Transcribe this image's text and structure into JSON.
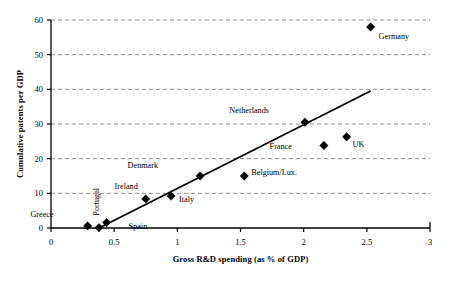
{
  "chart_data": {
    "type": "scatter",
    "title": "",
    "xlabel": "Gross R&D spending (as % of GDP)",
    "ylabel": "Cumulative patents per GDP",
    "xlim": [
      0,
      3
    ],
    "ylim": [
      0,
      60
    ],
    "xticks": [
      "0",
      "0.5",
      "1",
      "1.5",
      "2",
      "2.5",
      "3"
    ],
    "xtick_values": [
      0,
      0.5,
      1,
      1.5,
      2,
      2.5,
      3
    ],
    "yticks": [
      "0",
      "10",
      "20",
      "30",
      "40",
      "50",
      "60"
    ],
    "ytick_values": [
      0,
      10,
      20,
      30,
      40,
      50,
      60
    ],
    "grid": "horizontal-dashed",
    "legend": "none",
    "marker": "diamond",
    "marker_color": "#000000",
    "axis_color": "#000000",
    "grid_color": "#8c8c8c",
    "points": [
      {
        "label": "Greece",
        "x": 0.29,
        "y": 0.6,
        "label_dx": -34,
        "label_dy": -9,
        "rotate": 0
      },
      {
        "label": "Portugal",
        "x": 0.38,
        "y": 0.1,
        "label_dx": 0,
        "label_dy": -12,
        "rotate": -90
      },
      {
        "label": "Spain",
        "x": 0.44,
        "y": 1.6,
        "label_dx": 22,
        "label_dy": 7,
        "rotate": 0
      },
      {
        "label": "Ireland",
        "x": 0.75,
        "y": 8.4,
        "label_dx": -8,
        "label_dy": -10,
        "rotate": 0
      },
      {
        "label": "Italy",
        "x": 0.95,
        "y": 9.2,
        "label_dx": 8,
        "label_dy": 6,
        "rotate": 0
      },
      {
        "label": "Denmark",
        "x": 1.18,
        "y": 15.0,
        "label_dx": -42,
        "label_dy": -8,
        "rotate": 0
      },
      {
        "label": "Belgium/Lux.",
        "x": 1.53,
        "y": 15.0,
        "label_dx": 7,
        "label_dy": -1,
        "rotate": 0
      },
      {
        "label": "Netherlands",
        "x": 2.01,
        "y": 30.5,
        "label_dx": -36,
        "label_dy": -9,
        "rotate": 0
      },
      {
        "label": "France",
        "x": 2.16,
        "y": 23.8,
        "label_dx": -32,
        "label_dy": 4,
        "rotate": 0
      },
      {
        "label": "UK",
        "x": 2.34,
        "y": 26.3,
        "label_dx": 6,
        "label_dy": 10,
        "rotate": 0
      },
      {
        "label": "Germany",
        "x": 2.53,
        "y": 58.0,
        "label_dx": 8,
        "label_dy": 12,
        "rotate": 0
      }
    ],
    "trendline": {
      "x0": 0.38,
      "y0": 0.0,
      "x1": 2.53,
      "y1": 39.5,
      "color": "#000000"
    }
  }
}
